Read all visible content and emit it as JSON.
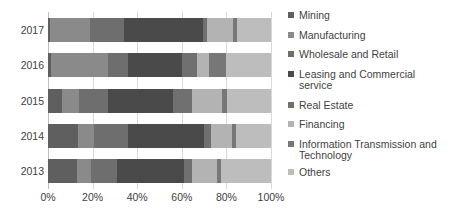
{
  "chart_data": {
    "type": "bar",
    "orientation": "horizontal",
    "stacked": true,
    "title": "",
    "xlabel": "",
    "ylabel": "",
    "xlim": [
      0,
      100
    ],
    "grid": true,
    "legend_position": "right",
    "categories": [
      "2017",
      "2016",
      "2015",
      "2014",
      "2013"
    ],
    "xticks": [
      "0%",
      "20%",
      "40%",
      "60%",
      "80%",
      "100%"
    ],
    "xtick_values": [
      0,
      20,
      40,
      60,
      80,
      100
    ],
    "series": [
      {
        "name": "Mining",
        "color": "#5f5f5f",
        "values": [
          0.8,
          1.2,
          6.5,
          13.5,
          13.0
        ]
      },
      {
        "name": "Manufacturing",
        "color": "#8a8a8a",
        "values": [
          18.0,
          25.5,
          7.5,
          7.0,
          6.5
        ]
      },
      {
        "name": "Wholesale and Retail",
        "color": "#6e6e6e",
        "values": [
          15.5,
          9.0,
          13.0,
          15.5,
          11.5
        ]
      },
      {
        "name": "Leasing and Commercial service",
        "color": "#4a4a4a",
        "values": [
          35.0,
          24.5,
          29.0,
          34.0,
          30.0
        ]
      },
      {
        "name": "Real Estate",
        "color": "#707070",
        "values": [
          2.0,
          6.5,
          8.5,
          3.0,
          3.5
        ]
      },
      {
        "name": "Financing",
        "color": "#b3b3b3",
        "values": [
          11.5,
          5.5,
          13.5,
          9.5,
          11.5
        ]
      },
      {
        "name": "Information Transmission and Technology",
        "color": "#777777",
        "values": [
          2.0,
          7.5,
          2.5,
          2.0,
          1.5
        ]
      },
      {
        "name": "Others",
        "color": "#bdbdbd",
        "values": [
          15.2,
          20.3,
          19.5,
          15.5,
          22.5
        ]
      }
    ]
  },
  "legend": {
    "items": [
      {
        "label": "Mining"
      },
      {
        "label": "Manufacturing"
      },
      {
        "label": "Wholesale and Retail"
      },
      {
        "label": "Leasing and Commercial service"
      },
      {
        "label": "Real Estate"
      },
      {
        "label": "Financing"
      },
      {
        "label": "Information Transmission and Technology"
      },
      {
        "label": "Others"
      }
    ]
  }
}
